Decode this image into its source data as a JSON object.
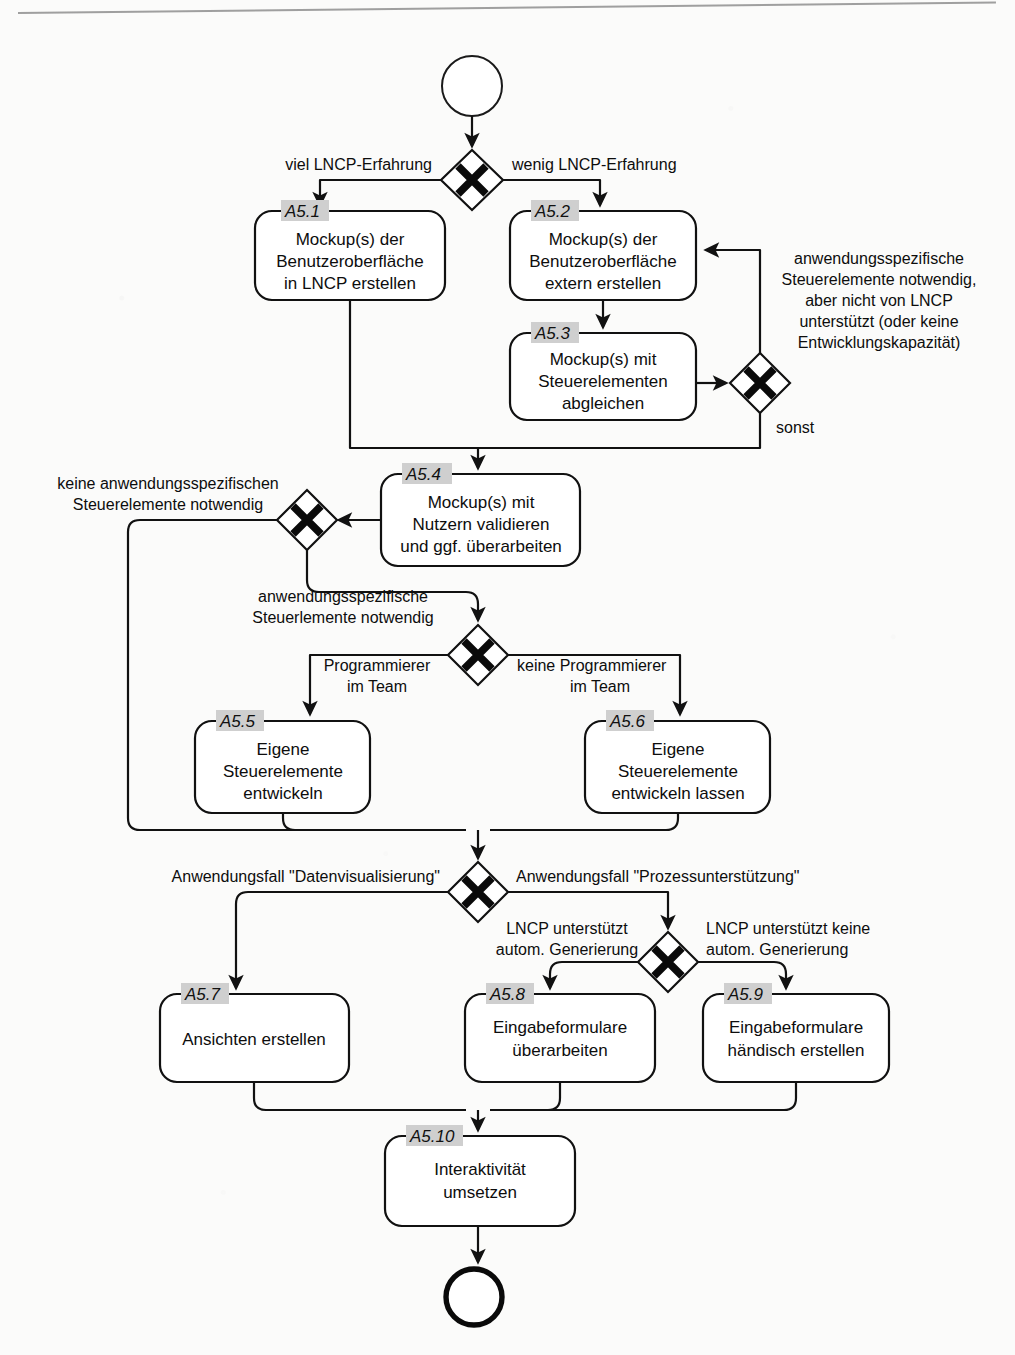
{
  "diagram": {
    "notation": "BPMN",
    "language": "de",
    "start_event": "start-event",
    "end_event": "end-event"
  },
  "tasks": [
    {
      "id": "A5.1",
      "lines": [
        "Mockup(s) der",
        "Benutzeroberfläche",
        "in LNCP erstellen"
      ]
    },
    {
      "id": "A5.2",
      "lines": [
        "Mockup(s) der",
        "Benutzeroberfläche",
        "extern erstellen"
      ]
    },
    {
      "id": "A5.3",
      "lines": [
        "Mockup(s) mit",
        "Steuerelementen",
        "abgleichen"
      ]
    },
    {
      "id": "A5.4",
      "lines": [
        "Mockup(s) mit",
        "Nutzern validieren",
        "und ggf. überarbeiten"
      ]
    },
    {
      "id": "A5.5",
      "lines": [
        "Eigene",
        "Steuerelemente",
        "entwickeln"
      ]
    },
    {
      "id": "A5.6",
      "lines": [
        "Eigene",
        "Steuerelemente",
        "entwickeln lassen"
      ]
    },
    {
      "id": "A5.7",
      "lines": [
        "Ansichten erstellen"
      ]
    },
    {
      "id": "A5.8",
      "lines": [
        "Eingabeformulare",
        "überarbeiten"
      ]
    },
    {
      "id": "A5.9",
      "lines": [
        "Eingabeformulare",
        "händisch erstellen"
      ]
    },
    {
      "id": "A5.10",
      "lines": [
        "Interaktivität",
        "umsetzen"
      ]
    }
  ],
  "gateways": [
    {
      "name": "gateway-lncp-erfahrung"
    },
    {
      "name": "gateway-steuerelemente-unterstuetzt"
    },
    {
      "name": "gateway-anwendungsspezifische-steuerelemente"
    },
    {
      "name": "gateway-programmierer-im-team"
    },
    {
      "name": "gateway-anwendungsfall"
    },
    {
      "name": "gateway-autom-generierung"
    }
  ],
  "labels": {
    "viel_erfahrung": "viel LNCP-Erfahrung",
    "wenig_erfahrung": "wenig LNCP-Erfahrung",
    "annotation_nicht_unterstuetzt": [
      "anwendungsspezifische",
      "Steuerelemente notwendig,",
      "aber nicht von LNCP",
      "unterstützt (oder keine",
      "Entwicklungskapazität)"
    ],
    "sonst": "sonst",
    "keine_anwendungsspezifischen": [
      "keine anwendungsspezifischen",
      "Steuerelemente notwendig"
    ],
    "anwendungsspezifische_notwendig": [
      "anwendungsspezifische",
      "Steuerlemente notwendig"
    ],
    "programmierer": [
      "Programmierer",
      "im Team"
    ],
    "keine_programmierer": [
      "keine Programmierer",
      "im Team"
    ],
    "anwendungsfall_daten": "Anwendungsfall \"Datenvisualisierung\"",
    "anwendungsfall_prozess": "Anwendungsfall \"Prozessunterstützung\"",
    "lncp_unterstuetzt": [
      "LNCP unterstützt",
      "autom. Generierung"
    ],
    "lncp_unterstuetzt_keine": [
      "LNCP unterstützt keine",
      "autom. Generierung"
    ]
  },
  "colors": {
    "stroke": "#111111",
    "background": "#fbfbfa",
    "id_badge": "#cfcfcf",
    "text": "#0d0d0d"
  }
}
